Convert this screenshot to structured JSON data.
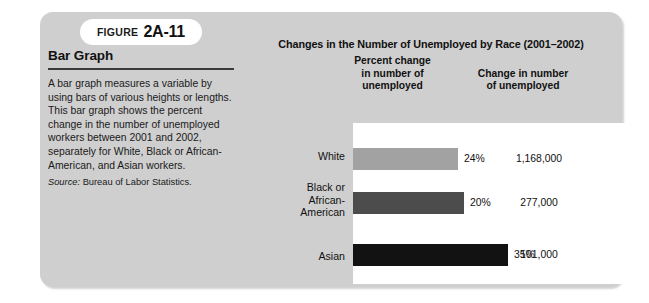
{
  "figure": {
    "badge_word": "Figure",
    "badge_number": "2A-11"
  },
  "left_panel": {
    "title": "Bar Graph",
    "body": "A bar graph measures a variable by using bars of various heights or lengths. This bar graph shows the percent change in the number of unemployed workers between 2001 and 2002, separately for White, Black or African-American, and Asian workers.",
    "source_label": "Source:",
    "source_text": "Bureau of Labor Statistics."
  },
  "chart_data": {
    "type": "bar",
    "orientation": "horizontal",
    "title": "Changes in the Number of Unemployed by Race (2001–2002)",
    "column_headers": [
      "Percent change in number of unemployed",
      "Change in number of unemployed"
    ],
    "column_header_lines": {
      "percent": [
        "Percent change",
        "in number of",
        "unemployed"
      ],
      "number": [
        "Change in number",
        "of unemployed"
      ]
    },
    "categories": [
      "White",
      "Black or African-American",
      "Asian"
    ],
    "category_label_lines": [
      [
        "White"
      ],
      [
        "Black or",
        "African-",
        "American"
      ],
      [
        "Asian"
      ]
    ],
    "values": [
      24,
      20,
      35
    ],
    "value_labels": [
      "24%",
      "20%",
      "35%"
    ],
    "counts": [
      1168000,
      277000,
      101000
    ],
    "count_labels": [
      "1,168,000",
      "277,000",
      "101,000"
    ],
    "xlabel": "",
    "ylabel": "",
    "xlim": [
      0,
      40
    ],
    "grid": false,
    "legend": false,
    "bar_colors": [
      "#a2a2a2",
      "#4c4c4c",
      "#121212"
    ],
    "plot_background": "#ffffff",
    "panel_background": "#cfcfcf"
  }
}
